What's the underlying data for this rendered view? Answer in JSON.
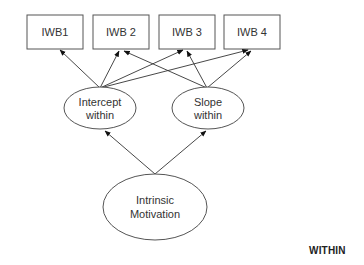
{
  "diagram": {
    "type": "path-model",
    "observed_indicators": [
      {
        "id": "iwb1",
        "label": "IWB1"
      },
      {
        "id": "iwb2",
        "label": "IWB 2"
      },
      {
        "id": "iwb3",
        "label": "IWB 3"
      },
      {
        "id": "iwb4",
        "label": "IWB 4"
      }
    ],
    "latent_nodes": [
      {
        "id": "intercept",
        "line1": "Intercept",
        "line2": "within"
      },
      {
        "id": "slope",
        "line1": "Slope",
        "line2": "within"
      },
      {
        "id": "intrinsic",
        "line1": "Intrinsic",
        "line2": "Motivation"
      }
    ],
    "edges": [
      {
        "from": "intercept",
        "to": "iwb1"
      },
      {
        "from": "intercept",
        "to": "iwb2"
      },
      {
        "from": "intercept",
        "to": "iwb3"
      },
      {
        "from": "intercept",
        "to": "iwb4"
      },
      {
        "from": "slope",
        "to": "iwb2"
      },
      {
        "from": "slope",
        "to": "iwb3"
      },
      {
        "from": "slope",
        "to": "iwb4"
      },
      {
        "from": "intrinsic",
        "to": "intercept"
      },
      {
        "from": "intrinsic",
        "to": "slope"
      }
    ],
    "level_label": "WITHIN",
    "colors": {
      "stroke": "#444444",
      "text": "#333333",
      "background": "#ffffff"
    }
  }
}
